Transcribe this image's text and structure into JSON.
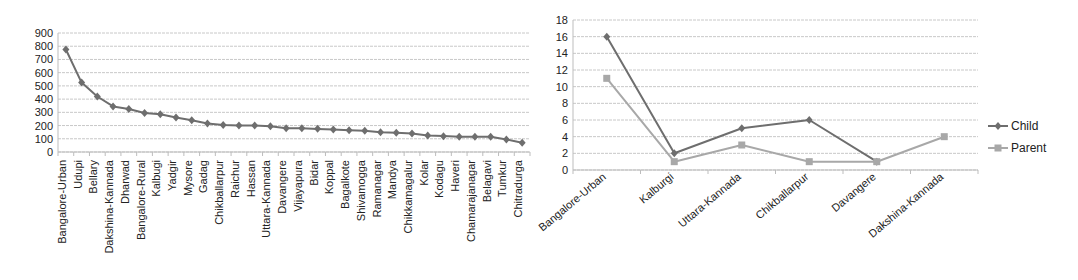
{
  "chart_data": [
    {
      "type": "line",
      "title": "",
      "xlabel": "",
      "ylabel": "",
      "ylim": [
        0,
        900
      ],
      "yticks": [
        0,
        100,
        200,
        300,
        400,
        500,
        600,
        700,
        800,
        900
      ],
      "grid": true,
      "legend": null,
      "categories": [
        "Bangalore-Urban",
        "Udupi",
        "Bellary",
        "Dakshina-Kannada",
        "Dharwad",
        "Bangalore-Rural",
        "Kalbugi",
        "Yadgir",
        "Mysore",
        "Gadag",
        "Chikballarpur",
        "Raichur",
        "Hassan",
        "Uttara-Kannada",
        "Davangere",
        "Vijayapura",
        "Bidar",
        "Koppal",
        "Bagalkote",
        "Shivamogga",
        "Ramanagar",
        "Mandya",
        "Chikkamagalur",
        "Kolar",
        "Kodagu",
        "Haveri",
        "Chamarajanagar",
        "Belagavi",
        "Tumkur",
        "Chitradurga"
      ],
      "series": [
        {
          "name": "",
          "color": "#6e6e6e",
          "marker": "diamond",
          "values": [
            775,
            525,
            420,
            345,
            325,
            295,
            285,
            260,
            240,
            215,
            205,
            200,
            200,
            195,
            180,
            180,
            175,
            170,
            165,
            160,
            150,
            145,
            140,
            125,
            120,
            115,
            115,
            115,
            95,
            70
          ]
        }
      ]
    },
    {
      "type": "line",
      "title": "",
      "xlabel": "",
      "ylabel": "",
      "ylim": [
        0,
        18
      ],
      "yticks": [
        0,
        2,
        4,
        6,
        8,
        10,
        12,
        14,
        16,
        18
      ],
      "grid": true,
      "legend": "right",
      "categories": [
        "Bangalore-Urban",
        "Kalburgi",
        "Uttara-Kannada",
        "Chikballarpur",
        "Davangere",
        "Dakshina-Kannada"
      ],
      "series": [
        {
          "name": "Child",
          "color": "#6e6e6e",
          "marker": "diamond",
          "values": [
            16,
            2,
            5,
            6,
            1,
            null
          ]
        },
        {
          "name": "Parent",
          "color": "#a8a8a8",
          "marker": "square",
          "values": [
            11,
            1,
            3,
            1,
            1,
            4
          ]
        }
      ]
    }
  ]
}
